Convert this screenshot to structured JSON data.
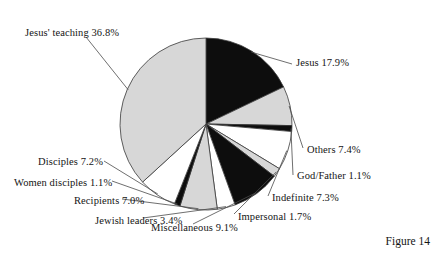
{
  "figure": {
    "caption": "Figure 14"
  },
  "colors": {
    "black": "#0d0d0d",
    "gray": "#d7d7d7",
    "white": "#ffffff",
    "outline": "#3a3a3a",
    "leader": "#4a4a4a",
    "background": "#ffffff",
    "text": "#141414"
  },
  "chart_data": {
    "type": "pie",
    "title": "",
    "start_angle_deg": 0,
    "direction": "clockwise",
    "center": [
      206,
      124
    ],
    "radius": 86,
    "legend_position": "outside-labels-with-leader-lines",
    "grid": false,
    "labels": [
      "Jesus' teaching 36.8%",
      "Jesus 17.9%",
      "Others 7.4%",
      "God/Father 1.1%",
      "Indefinite 7.3%",
      "Impersonal 1.7%",
      "Miscellaneous 9.1%",
      "Jewish leaders 3.4%",
      "Recipients 7.0%",
      "Women disciples 1.1%",
      "Disciples 7.2%"
    ],
    "categories": [
      "Jesus",
      "Others",
      "God/Father",
      "Indefinite",
      "Impersonal",
      "Miscellaneous",
      "Jewish leaders",
      "Recipients",
      "Women disciples",
      "Disciples",
      "Jesus' teaching"
    ],
    "values": [
      17.9,
      7.4,
      1.1,
      7.3,
      1.7,
      9.1,
      3.4,
      7.0,
      1.1,
      7.2,
      36.8
    ],
    "unit": "%",
    "slices": [
      {
        "name": "Jesus",
        "value": 17.9,
        "label": "Jesus 17.9%",
        "fill": "black"
      },
      {
        "name": "Others",
        "value": 7.4,
        "label": "Others 7.4%",
        "fill": "gray"
      },
      {
        "name": "God/Father",
        "value": 1.1,
        "label": "God/Father 1.1%",
        "fill": "black"
      },
      {
        "name": "Indefinite",
        "value": 7.3,
        "label": "Indefinite 7.3%",
        "fill": "white"
      },
      {
        "name": "Impersonal",
        "value": 1.7,
        "label": "Impersonal 1.7%",
        "fill": "gray"
      },
      {
        "name": "Miscellaneous",
        "value": 9.1,
        "label": "Miscellaneous 9.1%",
        "fill": "black"
      },
      {
        "name": "Jewish leaders",
        "value": 3.4,
        "label": "Jewish leaders 3.4%",
        "fill": "white"
      },
      {
        "name": "Recipients",
        "value": 7.0,
        "label": "Recipients 7.0%",
        "fill": "gray"
      },
      {
        "name": "Women disciples",
        "value": 1.1,
        "label": "Women disciples 1.1%",
        "fill": "black"
      },
      {
        "name": "Disciples",
        "value": 7.2,
        "label": "Disciples 7.2%",
        "fill": "white"
      },
      {
        "name": "Jesus' teaching",
        "value": 36.8,
        "label": "Jesus' teaching 36.8%",
        "fill": "gray"
      }
    ],
    "total": 100.0
  }
}
